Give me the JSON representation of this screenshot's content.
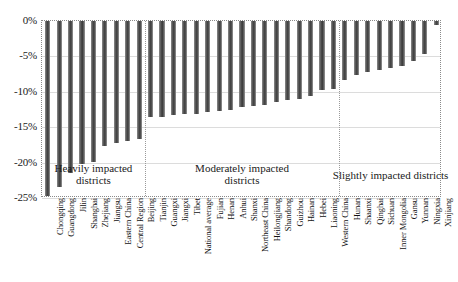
{
  "chart_data": {
    "type": "bar",
    "title": "",
    "subtitle": "",
    "xlabel": "",
    "ylabel": "",
    "ylim": [
      -25,
      0
    ],
    "yticks": [
      "0%",
      "-5%",
      "-10%",
      "-15%",
      "-20%",
      "-25%"
    ],
    "ytick_values": [
      0,
      -5,
      -10,
      -15,
      -20,
      -25
    ],
    "grid": true,
    "legend": null,
    "orientation": "vertical",
    "bar_color": "#4b4b4b",
    "categories": [
      "Chongqing",
      "Guangdong",
      "Jilin",
      "Shanghai",
      "Zhejiang",
      "Jiangsu",
      "Eastern China",
      "Central Region",
      "Beijing",
      "Tianjin",
      "Guangxi",
      "Jiangxi",
      "Tibet",
      "National average",
      "Fujian",
      "Henan",
      "Anhui",
      "Shanxi",
      "Northeast China",
      "Heilongjiang",
      "Shandong",
      "Guizhou",
      "Hainan",
      "Hebei",
      "Liaoning",
      "Western China",
      "Hunan",
      "Shaanxi",
      "Qinghai",
      "Sichuan",
      "Inner Mongolia",
      "Gansu",
      "Yunnan",
      "Ningxia",
      "Xinjiang"
    ],
    "values": [
      -24.7,
      -23.4,
      -21.4,
      -20.2,
      -19.9,
      -17.6,
      -17.2,
      -16.9,
      -16.6,
      -13.6,
      -13.5,
      -13.3,
      -13.2,
      -13.1,
      -12.9,
      -12.7,
      -12.5,
      -12.2,
      -12.0,
      -11.8,
      -11.4,
      -11.2,
      -11.0,
      -10.6,
      -9.8,
      -9.6,
      -8.4,
      -7.6,
      -7.2,
      -6.9,
      -6.6,
      -6.3,
      -5.6,
      -4.6,
      -0.5
    ],
    "annotations": [
      {
        "text": "Heavily impacted districts",
        "group": "heavily"
      },
      {
        "text": "Moderately impacted districts",
        "group": "moderately"
      },
      {
        "text": "Slightly impacted districts",
        "group": "slightly"
      }
    ],
    "group_dividers": [
      9,
      26
    ]
  },
  "sections": {
    "heavily": {
      "label_line1": "Heavily impacted",
      "label_line2": "districts"
    },
    "moderately": {
      "label_line1": "Moderately impacted",
      "label_line2": "districts"
    },
    "slightly": {
      "label_line1": "Slightly impacted districts",
      "label_line2": ""
    }
  }
}
